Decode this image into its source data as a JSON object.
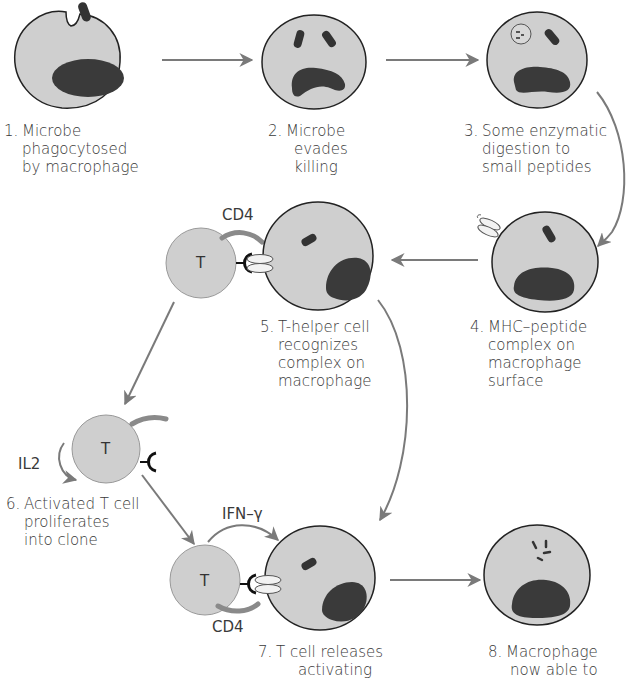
{
  "diagram": {
    "colors": {
      "cell_fill": "#cfcfcf",
      "cell_outline": "#222222",
      "nucleus": "#3a3a3a",
      "arrow": "#7a7a7a",
      "cd4": "#8a8a8a",
      "mhc": "#f2f2f2",
      "tcr": "#111111",
      "text": "#3a3a3a"
    },
    "steps": [
      {
        "num": "1.",
        "lines": [
          "Microbe",
          "phagocytosed",
          "by macrophage"
        ]
      },
      {
        "num": "2.",
        "lines": [
          "Microbe",
          "evades",
          "killing"
        ]
      },
      {
        "num": "3.",
        "lines": [
          "Some enzymatic",
          "digestion to",
          "small peptides"
        ]
      },
      {
        "num": "4.",
        "lines": [
          "MHC–peptide",
          "complex on",
          "macrophage",
          "surface"
        ]
      },
      {
        "num": "5.",
        "lines": [
          "T-helper cell",
          "recognizes",
          "complex on",
          "macrophage"
        ]
      },
      {
        "num": "6.",
        "lines": [
          "Activated T cell",
          "proliferates",
          "into clone"
        ]
      },
      {
        "num": "7.",
        "lines": [
          "T cell releases",
          "activating"
        ]
      },
      {
        "num": "8.",
        "lines": [
          "Macrophage",
          "now able to"
        ]
      }
    ],
    "tags": {
      "cd4_top": "CD4",
      "cd4_bottom": "CD4",
      "il2": "IL2",
      "ifn": "IFN–γ",
      "t_letter_1": "T",
      "t_letter_2": "T",
      "t_letter_3": "T"
    }
  }
}
